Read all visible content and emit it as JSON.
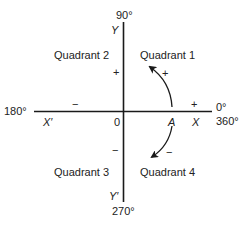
{
  "diagram": {
    "type": "angle-quadrants",
    "colors": {
      "line": "#1a1a1a",
      "text": "#222222",
      "background": "#ffffff"
    },
    "angles": {
      "top": "90°",
      "left": "180°",
      "right_top": "0°",
      "right_bottom": "360°",
      "bottom": "270°"
    },
    "axes": {
      "y_label": "Y",
      "y_prime_label": "Y′",
      "x_label": "X",
      "x_prime_label": "X′",
      "origin_label": "0",
      "point_label": "A"
    },
    "quadrants": [
      {
        "label": "Quadrant 1"
      },
      {
        "label": "Quadrant 2"
      },
      {
        "label": "Quadrant 3"
      },
      {
        "label": "Quadrant 4"
      }
    ],
    "signs": {
      "y_positive": "+",
      "x_negative": "−",
      "y_negative": "−",
      "x_positive": "+",
      "ccw_rotation": "+",
      "cw_rotation": "−"
    },
    "arrows": [
      {
        "name": "counterclockwise-positive-rotation",
        "direction": "counterclockwise"
      },
      {
        "name": "clockwise-negative-rotation",
        "direction": "clockwise"
      }
    ]
  }
}
